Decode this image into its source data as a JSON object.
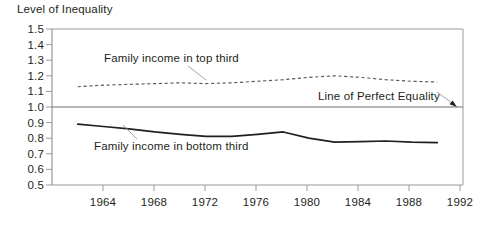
{
  "chart_data": {
    "type": "line",
    "title": "Level of Inequality",
    "xlabel": "",
    "ylabel": "Level of Inequality",
    "ylim": [
      0.5,
      1.5
    ],
    "xlim": [
      1964,
      1992
    ],
    "grid": false,
    "legend_position": "inline-annotations",
    "y_ticks": [
      "1.5",
      "1.4",
      "1.3",
      "1.2",
      "1.1",
      "1.0",
      "0.9",
      "0.8",
      "0.7",
      "0.6",
      "0.5"
    ],
    "y_tick_values": [
      1.5,
      1.4,
      1.3,
      1.2,
      1.1,
      1.0,
      0.9,
      0.8,
      0.7,
      0.6,
      0.5
    ],
    "x_ticks": [
      "1964",
      "1968",
      "1972",
      "1976",
      "1980",
      "1984",
      "1988",
      "1992"
    ],
    "x_tick_values": [
      1964,
      1968,
      1972,
      1976,
      1980,
      1984,
      1988,
      1992
    ],
    "x": [
      1964,
      1966,
      1968,
      1970,
      1972,
      1974,
      1976,
      1978,
      1980,
      1982,
      1984,
      1986,
      1988,
      1990,
      1992
    ],
    "series": [
      {
        "name": "Family income in top third",
        "style": "dashed",
        "color": "#5a5a5a",
        "values": [
          1.13,
          1.14,
          1.145,
          1.15,
          1.155,
          1.15,
          1.155,
          1.165,
          1.175,
          1.19,
          1.2,
          1.19,
          1.175,
          1.165,
          1.16
        ]
      },
      {
        "name": "Family income in bottom third",
        "style": "solid",
        "color": "#231f20",
        "values": [
          0.89,
          0.875,
          0.86,
          0.84,
          0.825,
          0.812,
          0.812,
          0.825,
          0.84,
          0.8,
          0.775,
          0.778,
          0.782,
          0.775,
          0.772
        ]
      },
      {
        "name": "Line of Perfect Equality",
        "style": "reference",
        "color": "#6e6e6e",
        "values": [
          1.0,
          1.0,
          1.0,
          1.0,
          1.0,
          1.0,
          1.0,
          1.0,
          1.0,
          1.0,
          1.0,
          1.0,
          1.0,
          1.0,
          1.0
        ]
      }
    ],
    "annotations": [
      {
        "text": "Family income in top third",
        "target_x": 1976,
        "target_y": 1.155
      },
      {
        "text": "Family income in bottom third",
        "target_x": 1968.5,
        "target_y": 0.855
      },
      {
        "text": "Line of Perfect Equality",
        "target_x": 1992,
        "target_y": 1.0
      }
    ]
  },
  "colors": {
    "frame": "#8c8c8c",
    "equality_line": "#6e6e6e",
    "dashed_series": "#5a5a5a",
    "solid_series": "#231f20",
    "text": "#231f20",
    "background": "#ffffff"
  }
}
